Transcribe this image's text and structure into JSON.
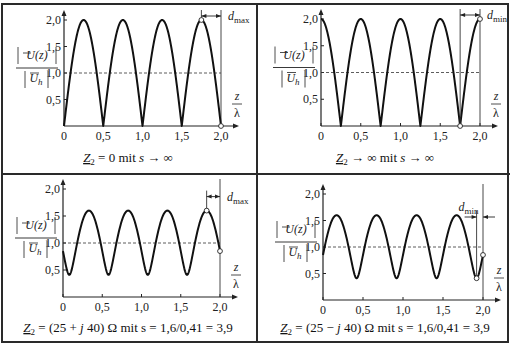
{
  "figure": {
    "y_label_num": "U(z)",
    "y_label_den": "U",
    "y_label_den_sub": "h",
    "x_label_num": "z",
    "x_label_den": "λ"
  },
  "chart_data": [
    {
      "type": "line",
      "panel": "top-left",
      "caption": "Z2 = 0 mit s → ∞",
      "caption_parts": {
        "lhs": "Z",
        "sub": "2",
        "rhs": " = 0  mit  ",
        "var": "s",
        "tail": " → ∞"
      },
      "xlabel": "z/λ",
      "ylabel": "|U(z)| / |U_h|",
      "x_ticks": [
        "0",
        "0,5",
        "1,0",
        "1,5",
        "2,0"
      ],
      "y_ticks": [
        "0,5",
        "1,0",
        "1,5",
        "2,0"
      ],
      "xlim": [
        0,
        2.0
      ],
      "ylim": [
        0,
        2.0
      ],
      "reference_line": {
        "y": 1.0,
        "style": "dashed"
      },
      "model": {
        "kind": "abs_sin",
        "amplitude": 2.0
      },
      "x": [
        0,
        0.25,
        0.5,
        0.75,
        1.0,
        1.25,
        1.5,
        1.75,
        2.0
      ],
      "y": [
        0,
        2.0,
        0,
        2.0,
        0,
        2.0,
        0,
        2.0,
        0
      ],
      "annotation": {
        "label": "d",
        "sub": "max",
        "from_x": 1.75,
        "to_x": 2.0,
        "marker_points": [
          [
            1.75,
            2.0
          ],
          [
            2.0,
            0
          ]
        ]
      }
    },
    {
      "type": "line",
      "panel": "top-right",
      "caption": "Z2 → ∞ mit s → ∞",
      "caption_parts": {
        "lhs": "Z",
        "sub": "2",
        "rhs": " → ∞  mit  ",
        "var": "s",
        "tail": " → ∞"
      },
      "xlabel": "z/λ",
      "ylabel": "|U(z)| / |U_h|",
      "x_ticks": [
        "0",
        "0,5",
        "1,0",
        "1,5",
        "2,0"
      ],
      "y_ticks": [
        "0,5",
        "1,0",
        "1,5",
        "2,0"
      ],
      "xlim": [
        0,
        2.0
      ],
      "ylim": [
        0,
        2.0
      ],
      "reference_line": {
        "y": 1.0,
        "style": "dashed"
      },
      "model": {
        "kind": "abs_cos",
        "amplitude": 2.0
      },
      "x": [
        0,
        0.25,
        0.5,
        0.75,
        1.0,
        1.25,
        1.5,
        1.75,
        2.0
      ],
      "y": [
        2.0,
        0,
        2.0,
        0,
        2.0,
        0,
        2.0,
        0,
        2.0
      ],
      "annotation": {
        "label": "d",
        "sub": "min",
        "from_x": 1.75,
        "to_x": 2.0,
        "marker_points": [
          [
            1.75,
            0
          ],
          [
            2.0,
            2.0
          ]
        ]
      }
    },
    {
      "type": "line",
      "panel": "bottom-left",
      "caption": "Z2 = (25 + j40) Ω mit s = 1,6/0,41 = 3,9",
      "caption_parts": {
        "lhs": "Z",
        "sub": "2",
        "rhs": " = (25 + ",
        "var": "j",
        "tail": " 40) Ω  mit  s = 1,6/0,41 = 3,9"
      },
      "xlabel": "z/λ",
      "ylabel": "|U(z)| / |U_h|",
      "x_ticks": [
        "0",
        "0,5",
        "1,0",
        "1,5",
        "2,0"
      ],
      "y_ticks": [
        "0,5",
        "1,0",
        "1,5",
        "2,0"
      ],
      "xlim": [
        0,
        2.0
      ],
      "ylim": [
        0,
        2.0
      ],
      "reference_line": {
        "y": 1.0,
        "style": "dashed"
      },
      "model": {
        "kind": "standing_wave",
        "max": 1.6,
        "min": 0.41,
        "max_at": 1.83
      },
      "x": [
        0,
        0.08,
        0.33,
        0.58,
        0.83,
        1.08,
        1.33,
        1.58,
        1.83,
        2.0
      ],
      "y": [
        0.85,
        0.41,
        1.6,
        0.41,
        1.6,
        0.41,
        1.6,
        0.41,
        1.6,
        0.85
      ],
      "annotation": {
        "label": "d",
        "sub": "max",
        "from_x": 1.83,
        "to_x": 2.0,
        "marker_points": [
          [
            1.83,
            1.6
          ],
          [
            2.0,
            0.85
          ]
        ]
      }
    },
    {
      "type": "line",
      "panel": "bottom-right",
      "caption": "Z2 = (25 − j40) Ω mit s = 1,6/0,41 = 3,9",
      "caption_parts": {
        "lhs": "Z",
        "sub": "2",
        "rhs": " = (25 − ",
        "var": "j",
        "tail": " 40) Ω  mit  s = 1,6/0,41 = 3,9"
      },
      "xlabel": "z/λ",
      "ylabel": "|U(z)| / |U_h|",
      "x_ticks": [
        "0",
        "0,5",
        "1,0",
        "1,5",
        "2,0"
      ],
      "y_ticks": [
        "0,5",
        "1,0",
        "1,5",
        "2,0"
      ],
      "xlim": [
        0,
        2.0
      ],
      "ylim": [
        0,
        2.0
      ],
      "reference_line": {
        "y": 1.0,
        "style": "dashed"
      },
      "model": {
        "kind": "standing_wave",
        "max": 1.6,
        "min": 0.41,
        "max_at": 1.67
      },
      "x": [
        0,
        0.17,
        0.42,
        0.67,
        0.92,
        1.17,
        1.42,
        1.67,
        1.92,
        2.0
      ],
      "y": [
        0.85,
        1.6,
        0.41,
        1.6,
        0.41,
        1.6,
        0.41,
        1.6,
        0.41,
        0.85
      ],
      "annotation": {
        "label": "d",
        "sub": "min",
        "from_x": 1.92,
        "to_x": 2.0,
        "marker_points": [
          [
            1.92,
            0.41
          ],
          [
            2.0,
            0.85
          ]
        ]
      }
    }
  ]
}
